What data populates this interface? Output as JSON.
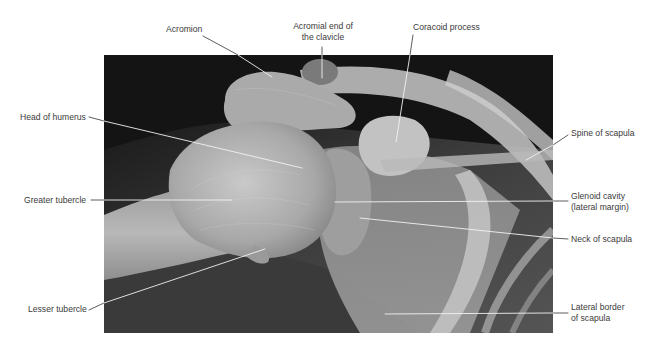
{
  "figure": {
    "xray_bounds": {
      "x": 104,
      "y": 55,
      "width": 449,
      "height": 278
    },
    "colors": {
      "background": "#ffffff",
      "xray_dark": "#141414",
      "bone": "#bdbdbd",
      "leader_on_xray": "#f2f2f2",
      "leader_on_white": "#333333",
      "label_text": "#3a3a3a"
    }
  },
  "labels": {
    "acromion": "Acromion",
    "acromial_end_line1": "Acromial end of",
    "acromial_end_line2": "the clavicle",
    "coracoid": "Coracoid process",
    "head_humerus": "Head of humerus",
    "spine_scapula": "Spine of scapula",
    "greater_tubercle": "Greater tubercle",
    "glenoid_line1": "Glenoid cavity",
    "glenoid_line2": "(lateral margin)",
    "neck_scapula": "Neck of scapula",
    "lesser_tubercle": "Lesser tubercle",
    "lateral_border_line1": "Lateral border",
    "lateral_border_line2": "of scapula"
  }
}
